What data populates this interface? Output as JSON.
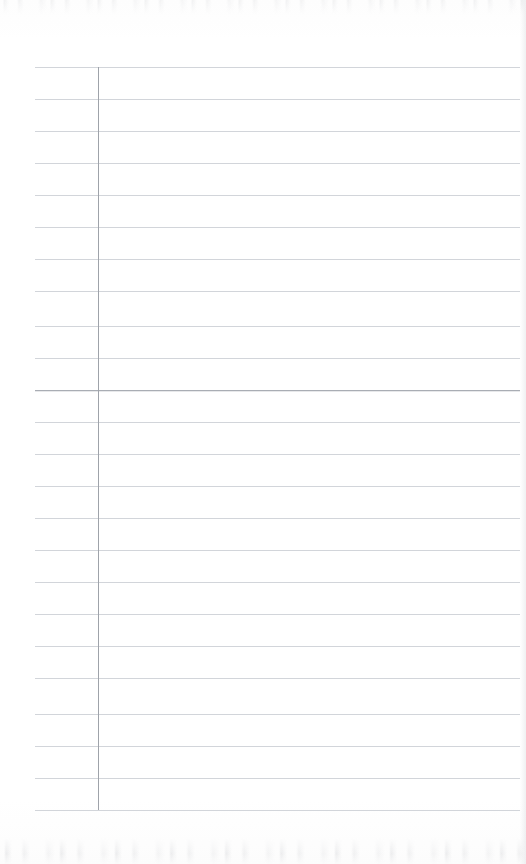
{
  "document": {
    "kind": "scanned-lined-notebook-page",
    "title": "Blank ruled notebook page",
    "page_width": 526,
    "page_height": 864,
    "paper_color": "#fefefe",
    "written_content": "",
    "has_handwriting": false,
    "has_printed_text": false
  },
  "rules": {
    "line_color": "#d2d5da",
    "emphasis_line_color": "#a9adb4",
    "margin_rule_color": "#9fa3aa",
    "line_start_x": 35,
    "line_end_x": 520,
    "margin_rule_x": 98,
    "margin_rule_top": 67,
    "margin_rule_bottom": 810,
    "line_spacing": 32.3,
    "line_count": 24,
    "emphasis_line_index": 10,
    "line_positions": [
      67,
      99,
      131,
      163,
      195,
      227,
      259,
      291,
      326,
      358,
      390,
      422,
      454,
      486,
      518,
      550,
      582,
      614,
      646,
      678,
      714,
      746,
      778,
      810
    ]
  },
  "artifacts": {
    "top_noise_band": {
      "y": 0,
      "height": 14
    },
    "bottom_noise_band": {
      "y": 838,
      "height": 26
    },
    "right_edge_shadow_x": 520
  }
}
